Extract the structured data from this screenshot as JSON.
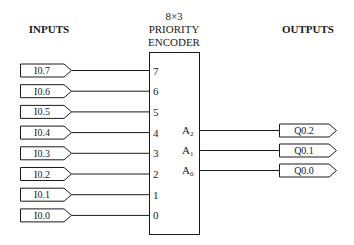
{
  "headers": {
    "inputs": "INPUTS",
    "outputs": "OUTPUTS"
  },
  "encoder": {
    "title_line1": "8×3",
    "title_line2": "PRIORITY",
    "title_line3": "ENCODER"
  },
  "inputs": [
    {
      "tag": "I0.7",
      "pin": "7"
    },
    {
      "tag": "I0.6",
      "pin": "6"
    },
    {
      "tag": "I0.5",
      "pin": "5"
    },
    {
      "tag": "I0.4",
      "pin": "4"
    },
    {
      "tag": "I0.3",
      "pin": "3"
    },
    {
      "tag": "I0.2",
      "pin": "2"
    },
    {
      "tag": "I0.1",
      "pin": "1"
    },
    {
      "tag": "I0.0",
      "pin": "0"
    }
  ],
  "outputs": [
    {
      "tag": "Q0.2",
      "pin": "A",
      "sub": "2"
    },
    {
      "tag": "Q0.1",
      "pin": "A",
      "sub": "1"
    },
    {
      "tag": "Q0.0",
      "pin": "A",
      "sub": "0"
    }
  ]
}
